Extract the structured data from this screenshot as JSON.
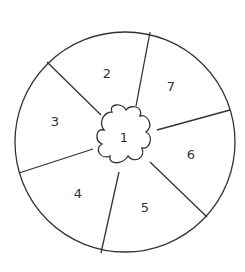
{
  "diagram": {
    "type": "segmented-circle",
    "stroke_color": "#333333",
    "center_label": "1",
    "segments": [
      {
        "label": "2",
        "x": 107,
        "y": 73
      },
      {
        "label": "7",
        "x": 171,
        "y": 86
      },
      {
        "label": "3",
        "x": 55,
        "y": 121
      },
      {
        "label": "6",
        "x": 191,
        "y": 154
      },
      {
        "label": "4",
        "x": 78,
        "y": 193
      },
      {
        "label": "5",
        "x": 145,
        "y": 207
      }
    ]
  }
}
